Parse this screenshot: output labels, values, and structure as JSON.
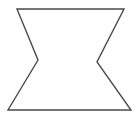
{
  "figure": {
    "name": "concave-hexagon",
    "alt_text": "Line drawing of a six-sided concave polygon",
    "vertex_count": 6,
    "canvas": {
      "width": 138,
      "height": 128,
      "background_color": "#ffffff"
    },
    "style": {
      "stroke_color": "#4a4a4a",
      "fill_color": "#ffffff",
      "stroke_width": 1.4
    },
    "vertices": [
      {
        "label": "top-left",
        "x": 17,
        "y": 9,
        "type": "convex"
      },
      {
        "label": "top-right",
        "x": 124,
        "y": 9,
        "type": "convex"
      },
      {
        "label": "right-notch",
        "x": 97,
        "y": 62,
        "type": "concave"
      },
      {
        "label": "bottom-right",
        "x": 131,
        "y": 110,
        "type": "convex"
      },
      {
        "label": "bottom-left",
        "x": 8,
        "y": 110,
        "type": "convex"
      },
      {
        "label": "left-notch",
        "x": 38,
        "y": 60,
        "type": "concave"
      }
    ],
    "points_string": "17,9 124,9 97,62 131,110 8,110 38,60",
    "edges": [
      {
        "label": "top-edge",
        "from": "top-left",
        "to": "top-right"
      },
      {
        "label": "upper-right-edge",
        "from": "top-right",
        "to": "right-notch"
      },
      {
        "label": "lower-right-edge",
        "from": "right-notch",
        "to": "bottom-right"
      },
      {
        "label": "bottom-edge",
        "from": "bottom-right",
        "to": "bottom-left"
      },
      {
        "label": "lower-left-edge",
        "from": "bottom-left",
        "to": "left-notch"
      },
      {
        "label": "upper-left-edge",
        "from": "left-notch",
        "to": "top-left"
      }
    ]
  }
}
